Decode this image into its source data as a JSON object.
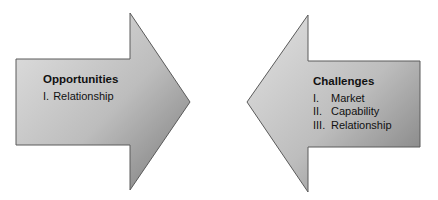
{
  "opportunities": {
    "title": "Opportunities",
    "items": [
      {
        "num": "I.",
        "label": "Relationship"
      }
    ]
  },
  "challenges": {
    "title": "Challenges",
    "items": [
      {
        "num": "I.",
        "label": "Market"
      },
      {
        "num": "II.",
        "label": "Capability"
      },
      {
        "num": "III.",
        "label": "Relationship"
      }
    ]
  },
  "colors": {
    "gradient_light": "#dedede",
    "gradient_dark": "#7e7e7e",
    "outline": "#555555",
    "text": "#111111"
  }
}
